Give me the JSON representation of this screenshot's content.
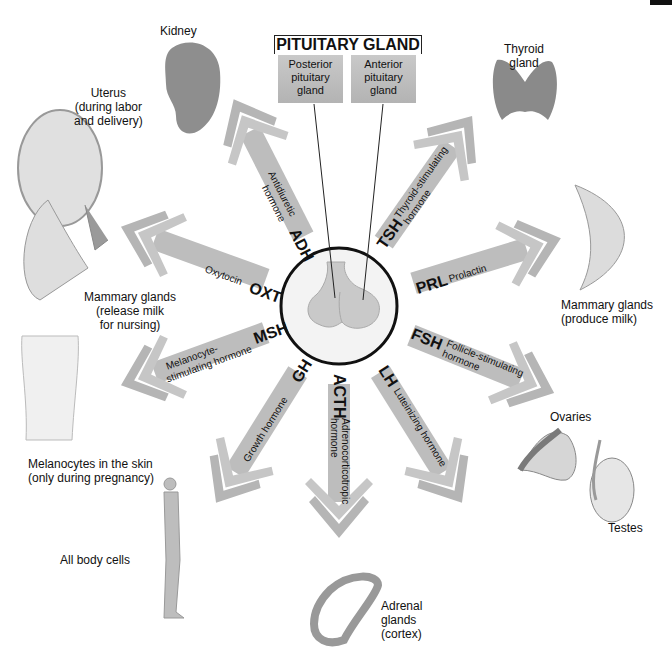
{
  "title": "PITUITARY GLAND",
  "lobes": {
    "posterior": "Posterior pituitary gland",
    "posterior_lines": [
      "Posterior",
      "pituitary",
      "gland"
    ],
    "anterior": "Anterior pituitary gland",
    "anterior_lines": [
      "Anterior",
      "pituitary",
      "gland"
    ]
  },
  "colors": {
    "arrow": "#b9b9b9",
    "arrow_dark": "#a3a3a3",
    "organ": "#8f8f8f",
    "circle_border": "#111111",
    "background": "#ffffff"
  },
  "hormones": [
    {
      "abbr": "ADH",
      "name": "Antidiuretic hormone",
      "name_lines": [
        "Antidiuretic",
        "hormone"
      ],
      "source": "posterior",
      "target": "Kidney"
    },
    {
      "abbr": "OXT",
      "name": "Oxytocin",
      "name_lines": [
        "Oxytocin"
      ],
      "source": "posterior",
      "target": "Uterus (during labor and delivery); Mammary glands (release milk for nursing)"
    },
    {
      "abbr": "TSH",
      "name": "Thyroid-stimulating hormone",
      "name_lines": [
        "Thyroid-stimulating",
        "hormone"
      ],
      "source": "anterior",
      "target": "Thyroid gland"
    },
    {
      "abbr": "PRL",
      "name": "Prolactin",
      "name_lines": [
        "Prolactin"
      ],
      "source": "anterior",
      "target": "Mammary glands (produce milk)"
    },
    {
      "abbr": "FSH",
      "name": "Follicle-stimulating hormone",
      "name_lines": [
        "Follicle-stimulating",
        "hormone"
      ],
      "source": "anterior",
      "target": "Ovaries; Testes"
    },
    {
      "abbr": "LH",
      "name": "Luteinizing hormone",
      "name_lines": [
        "Luteinizing hormone"
      ],
      "source": "anterior",
      "target": "Ovaries; Testes"
    },
    {
      "abbr": "ACTH",
      "name": "Adrenocorticotropic hormone",
      "name_lines": [
        "Adrenocorticotropic",
        "hormone"
      ],
      "source": "anterior",
      "target": "Adrenal glands (cortex)"
    },
    {
      "abbr": "GH",
      "name": "Growth hormone",
      "name_lines": [
        "Growth hormone"
      ],
      "source": "anterior",
      "target": "All body cells"
    },
    {
      "abbr": "MSH",
      "name": "Melanocyte-stimulating hormone",
      "name_lines": [
        "Melanocyte-",
        "stimulating hormone"
      ],
      "source": "anterior",
      "target": "Melanocytes in the skin (only during pregnancy)"
    }
  ],
  "targets": {
    "kidney": [
      "Kidney"
    ],
    "uterus": [
      "Uterus",
      "(during labor",
      "and delivery)"
    ],
    "mammary_release": [
      "Mammary glands",
      "(release milk",
      "for nursing)"
    ],
    "melanocytes": [
      "Melanocytes in the skin",
      "(only during pregnancy)"
    ],
    "all_cells": [
      "All body cells"
    ],
    "adrenal": [
      "Adrenal",
      "glands",
      "(cortex)"
    ],
    "ovaries": [
      "Ovaries"
    ],
    "testes": [
      "Testes"
    ],
    "mammary_produce": [
      "Mammary glands",
      "(produce milk)"
    ],
    "thyroid": [
      "Thyroid",
      "gland"
    ]
  }
}
